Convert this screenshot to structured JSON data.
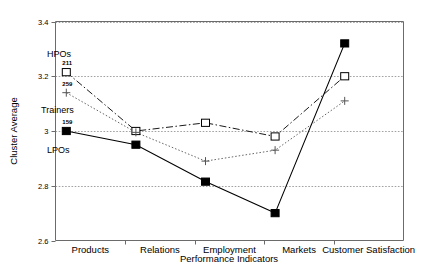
{
  "chart_data": {
    "type": "line",
    "title": "",
    "xlabel": "Performance Indicators",
    "ylabel": "Cluster Average",
    "categories": [
      "Products",
      "Relations",
      "Employment",
      "Markets",
      "Customer Satisfaction"
    ],
    "ylim": [
      2.6,
      3.4
    ],
    "yticks": [
      "2.6",
      "2.8",
      "3",
      "3.2",
      "3.4"
    ],
    "ytick_values": [
      2.6,
      2.8,
      3.0,
      3.2,
      3.4
    ],
    "grid": true,
    "legend": "inline-labels",
    "series": [
      {
        "name": "HPOs",
        "marker": "open-square",
        "line_style": "dash-dot",
        "color": "#000000",
        "point_label": "211",
        "values": [
          3.215,
          3.0,
          3.03,
          2.98,
          3.2
        ]
      },
      {
        "name": "Trainers",
        "marker": "plus",
        "line_style": "dotted",
        "color": "#555555",
        "point_label": "259",
        "values": [
          3.14,
          2.995,
          2.89,
          2.93,
          3.11
        ]
      },
      {
        "name": "LPOs",
        "marker": "filled-square",
        "line_style": "solid",
        "color": "#000000",
        "point_label": "159",
        "values": [
          3.0,
          2.95,
          2.815,
          2.7,
          3.32
        ]
      }
    ],
    "annotations": [
      {
        "text": "HPOs",
        "x": 47,
        "y": 57
      },
      {
        "text": "Trainers",
        "x": 41,
        "y": 113
      },
      {
        "text": "LPOs",
        "x": 47,
        "y": 153
      }
    ]
  }
}
